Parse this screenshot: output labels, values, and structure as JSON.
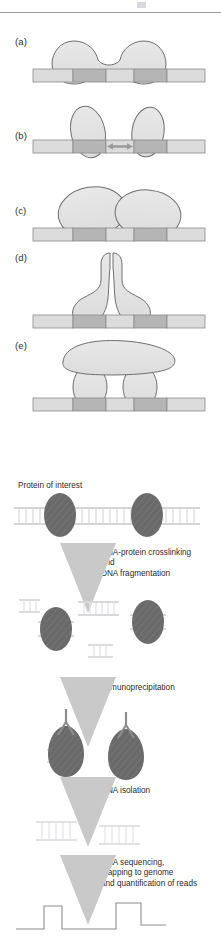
{
  "figure": {
    "top_panels": {
      "labels": [
        "(a)",
        "(b)",
        "(c)",
        "(d)",
        "(e)"
      ],
      "descriptions": [
        "Two proteins bound at adjacent sites contacting each other through a narrow bridge",
        "Two separate proteins bound at two binding sites separated by a spacer, double-headed arrow between them",
        "Two large overlapping proteins bound at adjacent binding sites",
        "A dimeric protein with two legs contacting two binding sites and a looped centre",
        "A large bridging protein sitting on top of two smaller DNA-bound proteins"
      ],
      "dna_segments": [
        "light",
        "dark",
        "light",
        "dark",
        "light"
      ]
    },
    "workflow": {
      "title_label": "Protein of interest",
      "steps": [
        "DNA-protein crosslinking\nand\nDNA fragmentation",
        "Immunoprecipitation",
        "DNA isolation",
        "DNA sequencing,\nmapping to genome\nand quantification of reads"
      ],
      "readout_peaks": 2,
      "readout_baseline": "flat",
      "icons": {
        "arrow": "down-arrow-icon",
        "protein": "protein-ellipse-icon",
        "antibody": "antibody-y-icon",
        "dna": "dna-duplex-icon",
        "peak_trace": "read-density-trace-icon"
      }
    },
    "colors": {
      "dna_light": "#dcdcdc",
      "dna_dark": "#b5b5b5",
      "protein_fill": "#e2e2e2",
      "protein_stroke": "#6e6e6e",
      "chip_protein": "#6a6a6a",
      "arrow_gray": "#c9c9c9",
      "dna_faint": "#d5d5d7",
      "dna_mid": "#a8a8aa",
      "text": "#2b2b2b",
      "rule": "#9a9a9e",
      "trace": "#8e8e90"
    }
  }
}
